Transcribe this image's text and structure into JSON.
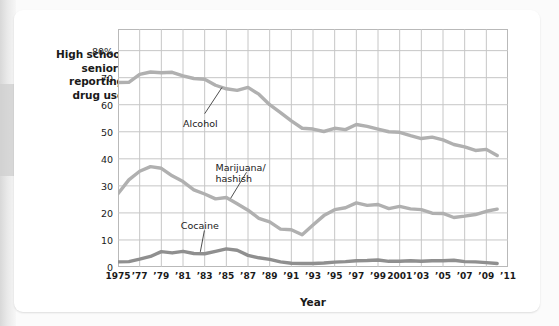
{
  "figure": {
    "y_axis_caption": "High school\nseniors\nreporting\ndrug use",
    "x_axis_caption": "Year"
  },
  "chart_data": {
    "type": "line",
    "title": "",
    "xlabel": "Year",
    "ylabel": "High school seniors reporting drug use",
    "ylim": [
      0,
      88
    ],
    "xlim": [
      1975,
      2011
    ],
    "grid": true,
    "legend_position": "inline-annotations",
    "y_ticks": [
      0,
      10,
      20,
      30,
      40,
      50,
      60,
      70,
      80
    ],
    "y_tick_labels": [
      "0",
      "10",
      "20",
      "30",
      "40",
      "50",
      "60",
      "70",
      "80%"
    ],
    "x_ticks": [
      1975,
      1977,
      1979,
      1981,
      1983,
      1985,
      1987,
      1989,
      1991,
      1993,
      1995,
      1997,
      1999,
      2001,
      2003,
      2005,
      2007,
      2009,
      2011
    ],
    "x_tick_labels": [
      "1975",
      "’77",
      "’79",
      "’81",
      "’83",
      "’85",
      "’87",
      "’89",
      "’91",
      "’93",
      "’95",
      "’97",
      "’99",
      "2001",
      "’03",
      "’05",
      "’07",
      "’09",
      "’11"
    ],
    "x": [
      1975,
      1976,
      1977,
      1978,
      1979,
      1980,
      1981,
      1982,
      1983,
      1984,
      1985,
      1986,
      1987,
      1988,
      1989,
      1990,
      1991,
      1992,
      1993,
      1994,
      1995,
      1996,
      1997,
      1998,
      1999,
      2000,
      2001,
      2002,
      2003,
      2004,
      2005,
      2006,
      2007,
      2008,
      2009,
      2010
    ],
    "series": [
      {
        "name": "Alcohol",
        "color": "#b0b0b0",
        "values": [
          68.2,
          68.3,
          71.2,
          72.1,
          71.8,
          72.0,
          70.7,
          69.7,
          69.4,
          67.2,
          65.9,
          65.3,
          66.4,
          63.9,
          60.0,
          57.1,
          54.0,
          51.3,
          51.0,
          50.1,
          51.3,
          50.8,
          52.7,
          52.0,
          51.0,
          50.0,
          49.8,
          48.6,
          47.5,
          48.0,
          47.0,
          45.3,
          44.4,
          43.1,
          43.5,
          41.2
        ]
      },
      {
        "name": "Marijuana/\nhashish",
        "color": "#b0b0b0",
        "values": [
          27.1,
          32.2,
          35.4,
          37.1,
          36.5,
          33.7,
          31.6,
          28.5,
          27.0,
          25.2,
          25.7,
          23.4,
          21.0,
          18.0,
          16.7,
          14.0,
          13.8,
          11.9,
          15.5,
          19.0,
          21.2,
          21.9,
          23.7,
          22.8,
          23.1,
          21.6,
          22.4,
          21.5,
          21.2,
          19.9,
          19.8,
          18.3,
          18.8,
          19.4,
          20.6,
          21.4
        ]
      },
      {
        "name": "Cocaine",
        "color": "#8f8f8f",
        "values": [
          1.9,
          2.0,
          2.9,
          3.9,
          5.7,
          5.2,
          5.8,
          5.0,
          4.9,
          5.8,
          6.7,
          6.2,
          4.3,
          3.4,
          2.8,
          1.9,
          1.4,
          1.3,
          1.3,
          1.5,
          1.8,
          2.0,
          2.3,
          2.4,
          2.6,
          2.1,
          2.1,
          2.3,
          2.1,
          2.3,
          2.3,
          2.5,
          2.0,
          1.9,
          1.6,
          1.3
        ]
      }
    ],
    "annotations": [
      {
        "label": "Alcohol",
        "label_x": 1981.0,
        "label_y": 53.0,
        "point_x": 1984.6,
        "point_y": 66.4
      },
      {
        "label": "Marijuana/\nhashish",
        "label_x": 1984.0,
        "label_y": 36.5,
        "point_x": 1985.4,
        "point_y": 25.4
      },
      {
        "label": "Cocaine",
        "label_x": 1980.8,
        "label_y": 15.0,
        "point_x": 1982.6,
        "point_y": 5.6
      }
    ]
  }
}
